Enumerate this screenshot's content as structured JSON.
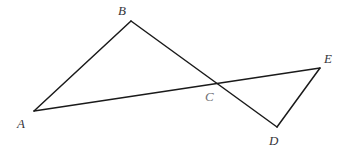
{
  "figure": {
    "background_color": "#ffffff",
    "stroke_color": "#1a1a1a",
    "stroke_width": 1.5,
    "label_color": "#35353a",
    "label_color_faint": "#6e6e73",
    "width": 351,
    "height": 155,
    "points": {
      "A": {
        "label": "A",
        "x": 34,
        "y": 111,
        "label_x": 17,
        "label_y": 117
      },
      "B": {
        "label": "B",
        "x": 131,
        "y": 21,
        "label_x": 118,
        "label_y": 4
      },
      "C": {
        "label": "C",
        "x": 214,
        "y": 81,
        "label_x": 205,
        "label_y": 90
      },
      "D": {
        "label": "D",
        "x": 277,
        "y": 127,
        "label_x": 269,
        "label_y": 134
      },
      "E": {
        "label": "E",
        "x": 320,
        "y": 68,
        "label_x": 324,
        "label_y": 52
      }
    },
    "segments": [
      {
        "name": "segment-AB",
        "from": "A",
        "to": "B",
        "d": "M 34 111 L 131 21"
      },
      {
        "name": "segment-BD",
        "from": "B",
        "to": "D",
        "d": "M 131 21 L 277 127"
      },
      {
        "name": "segment-AE",
        "from": "A",
        "to": "E",
        "d": "M 34 111 L 320 68"
      },
      {
        "name": "segment-DE",
        "from": "D",
        "to": "E",
        "d": "M 277 127 L 320 68"
      }
    ]
  }
}
